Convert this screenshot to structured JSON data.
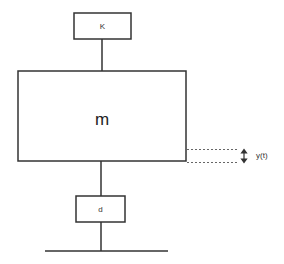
{
  "diagram": {
    "type": "mass-spring-damper",
    "spring": {
      "label": "K"
    },
    "mass": {
      "label": "m"
    },
    "damper": {
      "label": "d"
    },
    "displacement": {
      "label": "y(t)",
      "icon": "double-vertical-arrow-icon"
    },
    "ground": {
      "label": ""
    },
    "colors": {
      "line": "#333333",
      "dash": "#666666",
      "background": "#ffffff"
    }
  }
}
